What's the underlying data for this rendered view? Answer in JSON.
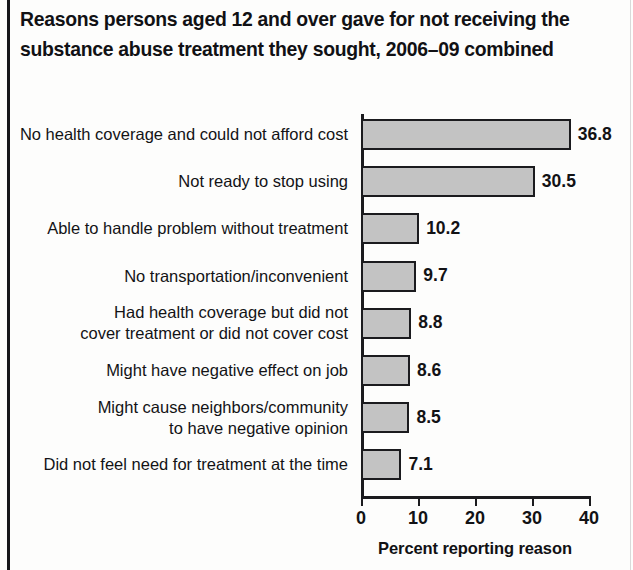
{
  "title": {
    "line1": "Reasons persons aged 12 and over gave for not receiving the",
    "line2": "substance abuse treatment they sought, 2006–09 combined"
  },
  "axis": {
    "x_title": "Percent reporting reason",
    "ticks": [
      "0",
      "10",
      "20",
      "30",
      "40"
    ]
  },
  "colors": {
    "bar_fill": "#c3c3c3",
    "bar_border": "#1b1b1e",
    "text": "#121215",
    "page_rule": "#17171a"
  },
  "chart_data": {
    "type": "bar",
    "orientation": "horizontal",
    "title": "Reasons persons aged 12 and over gave for not receiving the substance abuse treatment they sought, 2006–09 combined",
    "xlabel": "Percent reporting reason",
    "ylabel": "",
    "xlim": [
      0,
      40
    ],
    "xticks": [
      0,
      10,
      20,
      30,
      40
    ],
    "grid": false,
    "legend": false,
    "categories": [
      "No health coverage and could not afford cost",
      "Not ready to stop using",
      "Able to handle problem without treatment",
      "No transportation/inconvenient",
      "Had health coverage but did not cover treatment or did not cover cost",
      "Might have negative effect on job",
      "Might cause neighbors/community to have negative opinion",
      "Did not feel need for treatment at the time"
    ],
    "category_lines": [
      [
        "No health coverage and could not afford cost"
      ],
      [
        "Not ready to stop using"
      ],
      [
        "Able to handle problem without treatment"
      ],
      [
        "No transportation/inconvenient"
      ],
      [
        "Had health coverage but did not",
        "cover treatment or did not cover cost"
      ],
      [
        "Might have negative effect on job"
      ],
      [
        "Might cause neighbors/community",
        "to have negative opinion"
      ],
      [
        "Did not feel need for treatment at the time"
      ]
    ],
    "values": [
      36.8,
      30.5,
      10.2,
      9.7,
      8.8,
      8.6,
      8.5,
      7.1
    ],
    "value_labels": [
      "36.8",
      "30.5",
      "10.2",
      "9.7",
      "8.8",
      "8.6",
      "8.5",
      "7.1"
    ]
  }
}
